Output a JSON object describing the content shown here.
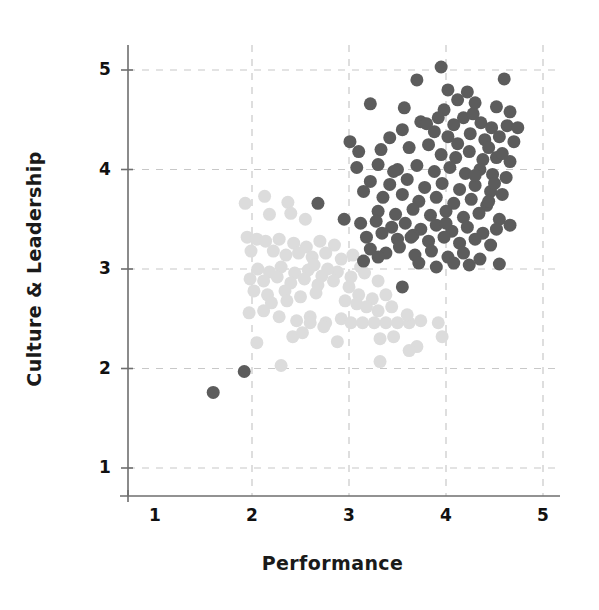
{
  "chart_data": {
    "type": "scatter",
    "title": "",
    "xlabel": "Performance",
    "ylabel": "Culture & Leadership",
    "xlim": [
      0.55,
      5.25
    ],
    "ylim": [
      0.55,
      5.4
    ],
    "xticks": [
      1,
      2,
      3,
      4,
      5
    ],
    "yticks": [
      1,
      2,
      3,
      4,
      5
    ],
    "xtick_labels": [
      "1",
      "2",
      "3",
      "4",
      "5"
    ],
    "ytick_labels": [
      "1",
      "2",
      "3",
      "4",
      "5"
    ],
    "grid": true,
    "grid_style": "dashed",
    "grid_color": "#c8c8c8",
    "axis_color": "#6e6e6e",
    "legend": "none",
    "marker_size_px": 13,
    "series": [
      {
        "name": "high-performing-group",
        "color": "#5c5c5c",
        "points": [
          [
            3.95,
            5.03
          ],
          [
            3.7,
            4.9
          ],
          [
            4.6,
            4.91
          ],
          [
            4.02,
            4.8
          ],
          [
            4.22,
            4.78
          ],
          [
            3.22,
            4.66
          ],
          [
            3.57,
            4.62
          ],
          [
            4.12,
            4.7
          ],
          [
            4.3,
            4.67
          ],
          [
            4.52,
            4.63
          ],
          [
            4.66,
            4.58
          ],
          [
            3.98,
            4.6
          ],
          [
            3.74,
            4.48
          ],
          [
            4.08,
            4.45
          ],
          [
            4.18,
            4.52
          ],
          [
            4.36,
            4.47
          ],
          [
            4.47,
            4.42
          ],
          [
            4.63,
            4.44
          ],
          [
            4.74,
            4.42
          ],
          [
            3.55,
            4.4
          ],
          [
            3.88,
            4.38
          ],
          [
            4.02,
            4.33
          ],
          [
            4.25,
            4.36
          ],
          [
            4.4,
            4.3
          ],
          [
            4.55,
            4.33
          ],
          [
            4.7,
            4.28
          ],
          [
            3.01,
            4.28
          ],
          [
            3.1,
            4.18
          ],
          [
            3.33,
            4.2
          ],
          [
            3.62,
            4.22
          ],
          [
            3.82,
            4.25
          ],
          [
            3.95,
            4.15
          ],
          [
            4.1,
            4.12
          ],
          [
            4.24,
            4.18
          ],
          [
            4.38,
            4.1
          ],
          [
            4.52,
            4.12
          ],
          [
            4.66,
            4.08
          ],
          [
            3.08,
            4.02
          ],
          [
            3.3,
            4.05
          ],
          [
            3.5,
            4.0
          ],
          [
            3.7,
            4.04
          ],
          [
            3.88,
            3.98
          ],
          [
            4.04,
            4.02
          ],
          [
            4.2,
            3.96
          ],
          [
            4.35,
            4.0
          ],
          [
            4.48,
            3.95
          ],
          [
            4.62,
            3.92
          ],
          [
            3.22,
            3.88
          ],
          [
            3.42,
            3.85
          ],
          [
            3.6,
            3.9
          ],
          [
            3.78,
            3.82
          ],
          [
            3.96,
            3.86
          ],
          [
            4.14,
            3.8
          ],
          [
            4.3,
            3.84
          ],
          [
            4.46,
            3.78
          ],
          [
            3.15,
            3.78
          ],
          [
            3.35,
            3.72
          ],
          [
            3.55,
            3.75
          ],
          [
            3.72,
            3.68
          ],
          [
            3.9,
            3.72
          ],
          [
            4.08,
            3.66
          ],
          [
            4.26,
            3.7
          ],
          [
            4.42,
            3.64
          ],
          [
            4.58,
            3.75
          ],
          [
            2.68,
            3.66
          ],
          [
            3.3,
            3.58
          ],
          [
            3.48,
            3.55
          ],
          [
            3.66,
            3.6
          ],
          [
            3.84,
            3.54
          ],
          [
            4.0,
            3.58
          ],
          [
            4.18,
            3.52
          ],
          [
            4.34,
            3.56
          ],
          [
            4.55,
            3.5
          ],
          [
            2.95,
            3.5
          ],
          [
            3.12,
            3.46
          ],
          [
            3.28,
            3.48
          ],
          [
            3.44,
            3.42
          ],
          [
            3.58,
            3.46
          ],
          [
            3.74,
            3.4
          ],
          [
            3.9,
            3.44
          ],
          [
            4.06,
            3.38
          ],
          [
            4.22,
            3.42
          ],
          [
            4.38,
            3.36
          ],
          [
            4.52,
            3.4
          ],
          [
            4.66,
            3.44
          ],
          [
            3.18,
            3.32
          ],
          [
            3.34,
            3.36
          ],
          [
            3.5,
            3.3
          ],
          [
            3.66,
            3.34
          ],
          [
            3.82,
            3.28
          ],
          [
            3.98,
            3.32
          ],
          [
            4.14,
            3.26
          ],
          [
            4.3,
            3.3
          ],
          [
            4.46,
            3.24
          ],
          [
            3.22,
            3.2
          ],
          [
            3.38,
            3.16
          ],
          [
            3.52,
            3.22
          ],
          [
            3.68,
            3.14
          ],
          [
            3.85,
            3.18
          ],
          [
            4.02,
            3.12
          ],
          [
            4.18,
            3.16
          ],
          [
            4.35,
            3.1
          ],
          [
            3.15,
            3.08
          ],
          [
            3.3,
            3.12
          ],
          [
            3.72,
            3.06
          ],
          [
            3.9,
            3.02
          ],
          [
            4.08,
            3.06
          ],
          [
            4.24,
            3.04
          ],
          [
            4.55,
            3.05
          ],
          [
            3.55,
            2.82
          ],
          [
            1.6,
            1.76
          ],
          [
            1.92,
            1.97
          ],
          [
            4.44,
            4.22
          ],
          [
            3.42,
            4.32
          ],
          [
            4.3,
            3.94
          ],
          [
            3.64,
            3.32
          ],
          [
            4.58,
            4.16
          ],
          [
            3.8,
            4.46
          ],
          [
            4.12,
            4.26
          ],
          [
            3.46,
            3.98
          ],
          [
            4.0,
            3.46
          ],
          [
            4.5,
            3.86
          ],
          [
            3.92,
            4.52
          ],
          [
            4.28,
            4.56
          ],
          [
            4.44,
            3.68
          ]
        ]
      },
      {
        "name": "lower-performing-group",
        "color": "#dcdcdc",
        "points": [
          [
            1.93,
            3.66
          ],
          [
            2.13,
            3.73
          ],
          [
            2.37,
            3.67
          ],
          [
            2.18,
            3.55
          ],
          [
            2.4,
            3.56
          ],
          [
            2.55,
            3.5
          ],
          [
            1.95,
            3.32
          ],
          [
            2.05,
            3.3
          ],
          [
            2.14,
            3.28
          ],
          [
            2.28,
            3.3
          ],
          [
            2.43,
            3.26
          ],
          [
            2.56,
            3.22
          ],
          [
            2.7,
            3.28
          ],
          [
            2.85,
            3.24
          ],
          [
            1.99,
            3.18
          ],
          [
            2.22,
            3.18
          ],
          [
            2.35,
            3.14
          ],
          [
            2.48,
            3.16
          ],
          [
            2.62,
            3.12
          ],
          [
            2.76,
            3.16
          ],
          [
            2.92,
            3.1
          ],
          [
            3.04,
            3.14
          ],
          [
            2.06,
            3.0
          ],
          [
            2.18,
            2.97
          ],
          [
            2.3,
            3.02
          ],
          [
            2.44,
            2.96
          ],
          [
            2.58,
            2.99
          ],
          [
            2.72,
            2.93
          ],
          [
            2.88,
            2.97
          ],
          [
            3.02,
            2.92
          ],
          [
            3.16,
            2.96
          ],
          [
            1.98,
            2.9
          ],
          [
            2.12,
            2.88
          ],
          [
            2.26,
            2.92
          ],
          [
            2.4,
            2.86
          ],
          [
            2.54,
            2.9
          ],
          [
            2.68,
            2.84
          ],
          [
            2.84,
            2.88
          ],
          [
            3.0,
            2.82
          ],
          [
            3.3,
            2.88
          ],
          [
            2.02,
            2.78
          ],
          [
            2.16,
            2.74
          ],
          [
            2.34,
            2.78
          ],
          [
            2.5,
            2.72
          ],
          [
            2.66,
            2.76
          ],
          [
            3.1,
            2.74
          ],
          [
            3.24,
            2.7
          ],
          [
            3.38,
            2.74
          ],
          [
            1.97,
            2.56
          ],
          [
            2.12,
            2.58
          ],
          [
            2.28,
            2.52
          ],
          [
            2.46,
            2.48
          ],
          [
            2.6,
            2.52
          ],
          [
            2.76,
            2.46
          ],
          [
            2.92,
            2.5
          ],
          [
            3.02,
            2.46
          ],
          [
            3.14,
            2.46
          ],
          [
            3.26,
            2.46
          ],
          [
            3.38,
            2.46
          ],
          [
            3.5,
            2.46
          ],
          [
            3.62,
            2.46
          ],
          [
            3.74,
            2.48
          ],
          [
            3.92,
            2.46
          ],
          [
            2.05,
            2.26
          ],
          [
            2.42,
            2.32
          ],
          [
            2.52,
            2.36
          ],
          [
            2.88,
            2.27
          ],
          [
            3.32,
            2.3
          ],
          [
            3.7,
            2.22
          ],
          [
            3.62,
            2.18
          ],
          [
            3.96,
            2.32
          ],
          [
            2.3,
            2.03
          ],
          [
            3.32,
            2.07
          ],
          [
            2.6,
            2.46
          ],
          [
            2.74,
            2.42
          ],
          [
            3.18,
            2.62
          ],
          [
            3.3,
            2.58
          ],
          [
            3.44,
            2.62
          ],
          [
            2.96,
            2.68
          ],
          [
            3.08,
            2.65
          ],
          [
            2.36,
            2.68
          ],
          [
            2.2,
            2.66
          ],
          [
            2.64,
            3.04
          ],
          [
            2.78,
            3.0
          ],
          [
            3.12,
            3.02
          ],
          [
            3.6,
            2.54
          ],
          [
            3.46,
            2.32
          ]
        ]
      }
    ]
  },
  "axis_titles": {
    "x": "Performance",
    "y": "Culture & Leadership"
  }
}
